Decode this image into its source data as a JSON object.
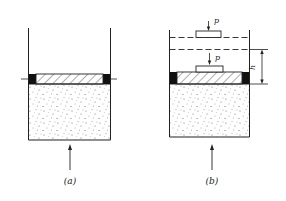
{
  "figure": {
    "type": "diagram",
    "colors": {
      "line": "#222222",
      "background": "#ffffff",
      "dots": "#555555"
    },
    "panels": [
      {
        "id": "a",
        "caption": "(a)",
        "parts": [
          "container-walls",
          "piston-hatched",
          "piston-seals",
          "sand-fill",
          "force-arrow-up",
          "side-ticks"
        ]
      },
      {
        "id": "b",
        "caption": "(b)",
        "force_label_top": "p",
        "force_label_bottom": "p",
        "dimension_label": "h",
        "parts": [
          "container-walls",
          "dashed-initial-level",
          "dashed-displaced-level",
          "weight-block-top",
          "weight-block-bottom",
          "piston-hatched",
          "piston-seals",
          "sand-fill",
          "force-arrow-up",
          "dimension-h"
        ]
      }
    ]
  }
}
